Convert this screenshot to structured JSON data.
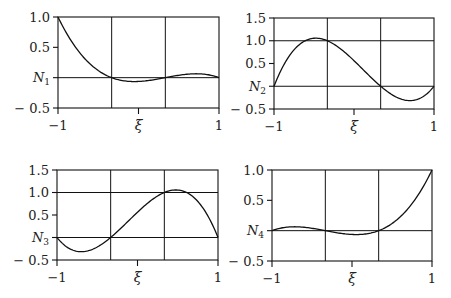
{
  "chart_data": [
    {
      "type": "line",
      "title": "",
      "xlabel": "ξ",
      "ylabel": "N1",
      "ylabel_sub": "1",
      "xlim": [
        -1,
        1
      ],
      "ylim": [
        -0.5,
        1.0
      ],
      "xticks": [
        -1,
        0,
        1
      ],
      "xtick_labels": [
        "−1",
        "",
        "1"
      ],
      "yticks": [
        1.0,
        0.5,
        0,
        -0.5
      ],
      "ytick_labels": [
        "1.0",
        "0.5",
        "",
        "− 0.5"
      ],
      "hgrid": [
        0
      ],
      "vgrid": [
        -0.3333,
        0.3333
      ],
      "grid": true,
      "box": {
        "left": 58,
        "right": 219,
        "top": 17,
        "bottom": 108
      },
      "series": [
        {
          "name": "N1",
          "formula": "lagrange cubic node 1",
          "x": [
            -1,
            -0.9,
            -0.8,
            -0.7,
            -0.6,
            -0.5,
            -0.4,
            -0.3333,
            -0.3,
            -0.2,
            -0.1,
            0,
            0.1,
            0.2,
            0.3,
            0.3333,
            0.4,
            0.5,
            0.6,
            0.7,
            0.8,
            0.9,
            1
          ],
          "values": [
            1.0,
            0.7695,
            0.5775,
            0.4208,
            0.296,
            0.1992,
            0.1271,
            0.0,
            0.0,
            -0.0486,
            -0.0734,
            -0.0625,
            -0.0448,
            -0.035,
            -0.0098,
            0.0,
            0.0245,
            0.0469,
            0.0607,
            0.0638,
            0.0551,
            0.0349,
            0.0
          ]
        }
      ]
    },
    {
      "type": "line",
      "title": "",
      "xlabel": "ξ",
      "ylabel": "N2",
      "ylabel_sub": "2",
      "xlim": [
        -1,
        1
      ],
      "ylim": [
        -0.5,
        1.5
      ],
      "xticks": [
        -1,
        0,
        1
      ],
      "xtick_labels": [
        "−1",
        "",
        "1"
      ],
      "yticks": [
        1.5,
        1.0,
        0.5,
        0,
        -0.5
      ],
      "ytick_labels": [
        "1.5",
        "1.0",
        "0.5",
        "",
        "− 0.5"
      ],
      "hgrid": [
        0,
        1.0
      ],
      "vgrid": [
        -0.3333,
        0.3333
      ],
      "grid": true,
      "box": {
        "left": 274,
        "right": 434,
        "top": 18,
        "bottom": 109
      },
      "series": [
        {
          "name": "N2",
          "formula": "lagrange cubic node 2"
        }
      ]
    },
    {
      "type": "line",
      "title": "",
      "xlabel": "ξ",
      "ylabel": "N3",
      "ylabel_sub": "3",
      "xlim": [
        -1,
        1
      ],
      "ylim": [
        -0.5,
        1.5
      ],
      "xticks": [
        -1,
        0,
        1
      ],
      "xtick_labels": [
        "−1",
        "",
        "1"
      ],
      "yticks": [
        1.5,
        1.0,
        0.5,
        0,
        -0.5
      ],
      "ytick_labels": [
        "1.5",
        "1.0",
        "0.5",
        "",
        "− 0.5"
      ],
      "hgrid": [
        0,
        1.0
      ],
      "vgrid": [
        -0.3333,
        0.3333
      ],
      "grid": true,
      "box": {
        "left": 57,
        "right": 218,
        "top": 170,
        "bottom": 260
      },
      "series": [
        {
          "name": "N3",
          "formula": "lagrange cubic node 3"
        }
      ]
    },
    {
      "type": "line",
      "title": "",
      "xlabel": "ξ",
      "ylabel": "N4",
      "ylabel_sub": "4",
      "xlim": [
        -1,
        1
      ],
      "ylim": [
        -0.5,
        1.0
      ],
      "xticks": [
        -1,
        0,
        1
      ],
      "xtick_labels": [
        "−1",
        "",
        "1"
      ],
      "yticks": [
        1.0,
        0.5,
        0,
        -0.5
      ],
      "ytick_labels": [
        "1.0",
        "0.5",
        "",
        "− 0.5"
      ],
      "hgrid": [
        0
      ],
      "vgrid": [
        -0.3333,
        0.3333
      ],
      "grid": true,
      "box": {
        "left": 272,
        "right": 432,
        "top": 170,
        "bottom": 261
      },
      "series": [
        {
          "name": "N4",
          "formula": "lagrange cubic node 4"
        }
      ]
    }
  ],
  "nodes": [
    -1,
    -0.333333,
    0.333333,
    1
  ],
  "colors": {
    "line": "#111111",
    "text": "#222222",
    "background": "#ffffff"
  }
}
